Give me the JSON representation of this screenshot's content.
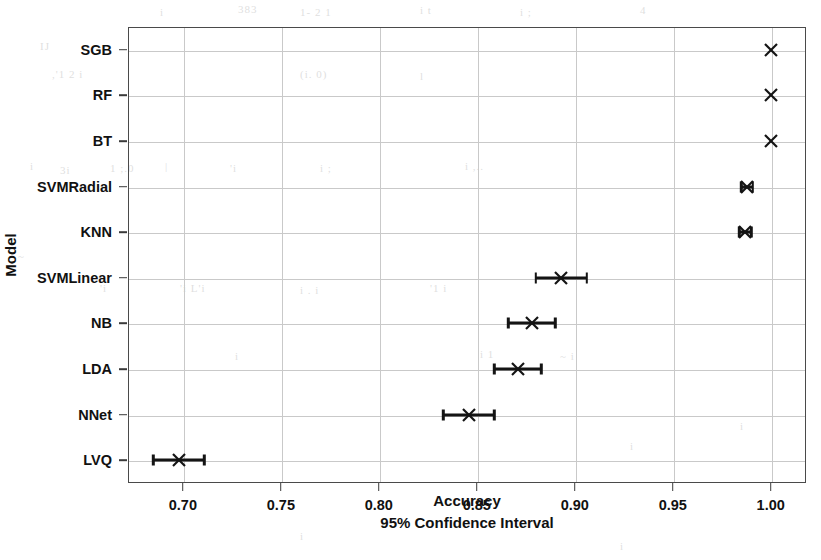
{
  "chart_data": {
    "type": "scatter",
    "title": "",
    "xlabel": "Accuracy",
    "sublabel": "95% Confidence Interval",
    "ylabel": "Model",
    "xlim": [
      0.672,
      1.018
    ],
    "xticks": [
      "0.70",
      "0.75",
      "0.80",
      "0.85",
      "0.90",
      "0.95",
      "1.00"
    ],
    "xtick_values": [
      0.7,
      0.75,
      0.8,
      0.85,
      0.9,
      0.95,
      1.0
    ],
    "grid": true,
    "legend": false,
    "marker": "x-cross",
    "series_name": "Mean accuracy with 95% CI",
    "categories": [
      "SGB",
      "RF",
      "BT",
      "SVMRadial",
      "KNN",
      "SVMLinear",
      "NB",
      "LDA",
      "NNet",
      "LVQ"
    ],
    "points": [
      {
        "model": "SGB",
        "value": 1.0,
        "lower": 1.0,
        "upper": 1.0
      },
      {
        "model": "RF",
        "value": 1.0,
        "lower": 1.0,
        "upper": 1.0
      },
      {
        "model": "BT",
        "value": 1.0,
        "lower": 1.0,
        "upper": 1.0
      },
      {
        "model": "SVMRadial",
        "value": 0.988,
        "lower": 0.985,
        "upper": 0.991
      },
      {
        "model": "KNN",
        "value": 0.987,
        "lower": 0.984,
        "upper": 0.99
      },
      {
        "model": "SVMLinear",
        "value": 0.893,
        "lower": 0.88,
        "upper": 0.906
      },
      {
        "model": "NB",
        "value": 0.878,
        "lower": 0.866,
        "upper": 0.89
      },
      {
        "model": "LDA",
        "value": 0.871,
        "lower": 0.859,
        "upper": 0.883
      },
      {
        "model": "NNet",
        "value": 0.846,
        "lower": 0.833,
        "upper": 0.859
      },
      {
        "model": "LVQ",
        "value": 0.698,
        "lower": 0.685,
        "upper": 0.711
      }
    ],
    "colors": {
      "marker": "#141414",
      "errorbar": "#141414",
      "grid": "#c9c9c9",
      "axis": "#4a4a4a",
      "text": "#111111",
      "background": "#ffffff"
    }
  },
  "ghosts": [
    {
      "text": "i",
      "x": 160,
      "y": 6
    },
    {
      "text": "383",
      "x": 238,
      "y": 3
    },
    {
      "text": "1-  2  1",
      "x": 300,
      "y": 6
    },
    {
      "text": "i    t",
      "x": 420,
      "y": 4
    },
    {
      "text": "i  ;",
      "x": 520,
      "y": 6
    },
    {
      "text": "4",
      "x": 640,
      "y": 4
    },
    {
      "text": "IJ",
      "x": 40,
      "y": 40
    },
    {
      "text": ",'1 2 i",
      "x": 52,
      "y": 68
    },
    {
      "text": "(i.  0)",
      "x": 300,
      "y": 68
    },
    {
      "text": "l",
      "x": 420,
      "y": 70
    },
    {
      "text": "i",
      "x": 30,
      "y": 160
    },
    {
      "text": "3i",
      "x": 60,
      "y": 164
    },
    {
      "text": "1 ;.0",
      "x": 110,
      "y": 162
    },
    {
      "text": "|",
      "x": 165,
      "y": 160
    },
    {
      "text": "'i",
      "x": 230,
      "y": 162
    },
    {
      "text": "i   ;",
      "x": 320,
      "y": 162
    },
    {
      "text": "i  ,..",
      "x": 465,
      "y": 160
    },
    {
      "text": "~",
      "x": 18,
      "y": 250
    },
    {
      "text": "'i",
      "x": 100,
      "y": 282
    },
    {
      "text": "'i L'i",
      "x": 180,
      "y": 282
    },
    {
      "text": "i  .  i",
      "x": 300,
      "y": 284
    },
    {
      "text": "'1     i",
      "x": 430,
      "y": 282
    },
    {
      "text": "i",
      "x": 235,
      "y": 350
    },
    {
      "text": "i  1",
      "x": 480,
      "y": 348
    },
    {
      "text": "~  i",
      "x": 560,
      "y": 350
    },
    {
      "text": "i",
      "x": 630,
      "y": 440
    },
    {
      "text": "i",
      "x": 740,
      "y": 420
    },
    {
      "text": "i",
      "x": 300,
      "y": 530
    },
    {
      "text": "i",
      "x": 620,
      "y": 540
    }
  ]
}
